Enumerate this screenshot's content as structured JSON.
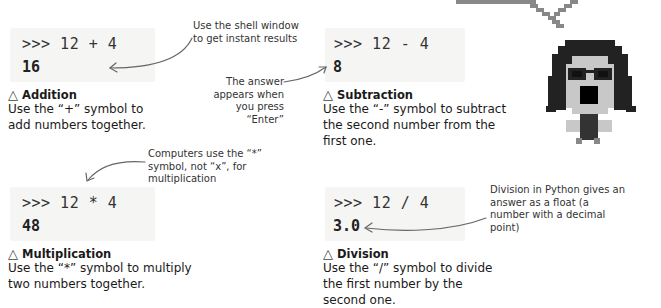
{
  "operations": [
    {
      "id": "addition",
      "prompt": ">>> 12 + 4",
      "result": "16",
      "title": "Addition",
      "description": "Use the “+” symbol to add numbers together."
    },
    {
      "id": "subtraction",
      "prompt": ">>> 12 - 4",
      "result": "8",
      "title": "Subtraction",
      "description": "Use the “-” symbol to subtract the second number from the first one."
    },
    {
      "id": "multiplication",
      "prompt": ">>> 12 * 4",
      "result": "48",
      "title": "Multiplication",
      "description": "Use the “*” symbol to multiply two numbers together."
    },
    {
      "id": "division",
      "prompt": ">>> 12 / 4",
      "result": "3.0",
      "title": "Division",
      "description": "Use the “/” symbol to divide the first number by the second one."
    }
  ],
  "annotations": {
    "shell_window": "Use the shell window to get instant results",
    "answer_enter": "The answer appears when you press “Enter”",
    "multiply_symbol": "Computers use the “*” symbol, not “x”, for multiplication",
    "division_float": "Division in Python gives an answer as a float (a number with a decimal point)"
  },
  "triangle_glyph": "△",
  "colors": {
    "shell_bg": "#f5f5f3",
    "arrow": "#666666",
    "pixel_dark": "#222222",
    "pixel_light": "#c8c8c8",
    "pixel_mid": "#888888"
  }
}
